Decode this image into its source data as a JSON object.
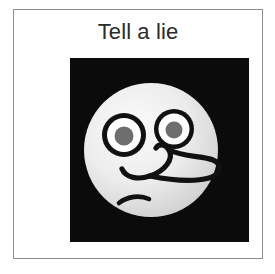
{
  "card": {
    "title": "Tell a lie",
    "border_color": "#8d8d8d",
    "background_color": "#ffffff",
    "title_color": "#2b2b2b"
  },
  "pictogram": {
    "name": "lying-face-pictogram",
    "panel_background_color": "#0b0b0b",
    "face": {
      "shape": "circle",
      "fill_light": "#f2f2f2",
      "fill_shadow": "#c9c9c9",
      "outline_color": "#111111"
    },
    "eyes": {
      "count": 2,
      "ring_color": "#111111",
      "sclera_color": "#ffffff",
      "pupil_color": "#6e6e6e"
    },
    "nose": {
      "description": "long curved pinocchio nose",
      "stroke_color": "#111111"
    },
    "mouth": {
      "description": "short downturned frown",
      "stroke_color": "#111111"
    }
  }
}
